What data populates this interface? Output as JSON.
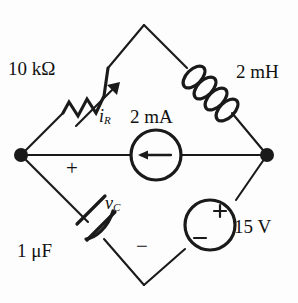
{
  "figure": {
    "kind": "circuit-schematic",
    "topology": "diamond-bridge",
    "background_color": "#fdfdfd",
    "line_color": "#1a1a1a"
  },
  "labels": {
    "resistor_value": "10 kΩ",
    "inductor_value": "2 mH",
    "capacitor_value": "1 μF",
    "current_source_value": "2 mA",
    "voltage_source_value": "15 V",
    "resistor_current_symbol": "i",
    "resistor_current_subscript": "R",
    "capacitor_voltage_symbol": "v",
    "capacitor_voltage_subscript": "C",
    "capacitor_polarity_plus": "+",
    "capacitor_polarity_minus": "−",
    "source_polarity_plus": "+",
    "source_polarity_minus": "−"
  },
  "nodes": {
    "top": {
      "x": 144,
      "y": 25
    },
    "left": {
      "x": 21,
      "y": 155
    },
    "right": {
      "x": 267,
      "y": 155
    },
    "bottom": {
      "x": 144,
      "y": 285
    },
    "left_dot_radius": 7,
    "right_dot_radius": 7
  },
  "components": [
    {
      "name": "resistor",
      "type": "resistor",
      "branch": "left-to-top",
      "value": "10 kΩ",
      "current_label": "iR",
      "current_direction": "toward-top-node"
    },
    {
      "name": "inductor",
      "type": "inductor",
      "branch": "top-to-right",
      "value": "2 mH",
      "coil_loops": 4
    },
    {
      "name": "capacitor",
      "type": "capacitor",
      "branch": "left-to-bottom",
      "value": "1 μF",
      "voltage_label": "vC",
      "plus_terminal": "left-node-side",
      "minus_terminal": "bottom-node-side"
    },
    {
      "name": "voltage-source",
      "type": "independent-voltage-source",
      "branch": "bottom-to-right",
      "value": "15 V",
      "plus_terminal": "upper-right",
      "minus_terminal": "lower-left"
    },
    {
      "name": "current-source",
      "type": "independent-current-source",
      "branch": "left-to-right-middle",
      "value": "2 mA",
      "arrow_direction": "left"
    }
  ]
}
